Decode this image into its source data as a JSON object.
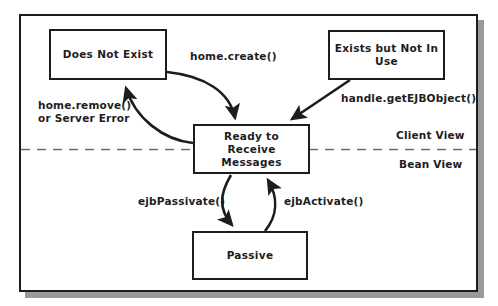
{
  "diagram": {
    "states": [
      {
        "id": "does-not-exist",
        "label": "Does Not Exist"
      },
      {
        "id": "exists-not-in-use",
        "label": "Exists but Not In Use"
      },
      {
        "id": "ready",
        "label": "Ready to\nReceive\nMessages"
      },
      {
        "id": "passive",
        "label": "Passive"
      }
    ],
    "transitions": [
      {
        "id": "home-create",
        "label": "home.create()",
        "from": "does-not-exist",
        "to": "ready"
      },
      {
        "id": "home-remove",
        "label": "home.remove()\nor Server Error",
        "from": "ready",
        "to": "does-not-exist"
      },
      {
        "id": "handle-get",
        "label": "handle.getEJBObject()",
        "from": "exists-not-in-use",
        "to": "ready"
      },
      {
        "id": "ejb-passivate",
        "label": "ejbPassivate()",
        "from": "ready",
        "to": "passive"
      },
      {
        "id": "ejb-activate",
        "label": "ejbActivate()",
        "from": "passive",
        "to": "ready"
      }
    ],
    "partition": {
      "above_label": "Client View",
      "below_label": "Bean View",
      "style": "dashed"
    },
    "colors": {
      "stroke": "#1d1d1d",
      "text": "#1d1d1d",
      "background": "#ffffff",
      "shadow": "#9a9a9a",
      "divider": "#6b6b6b"
    }
  }
}
